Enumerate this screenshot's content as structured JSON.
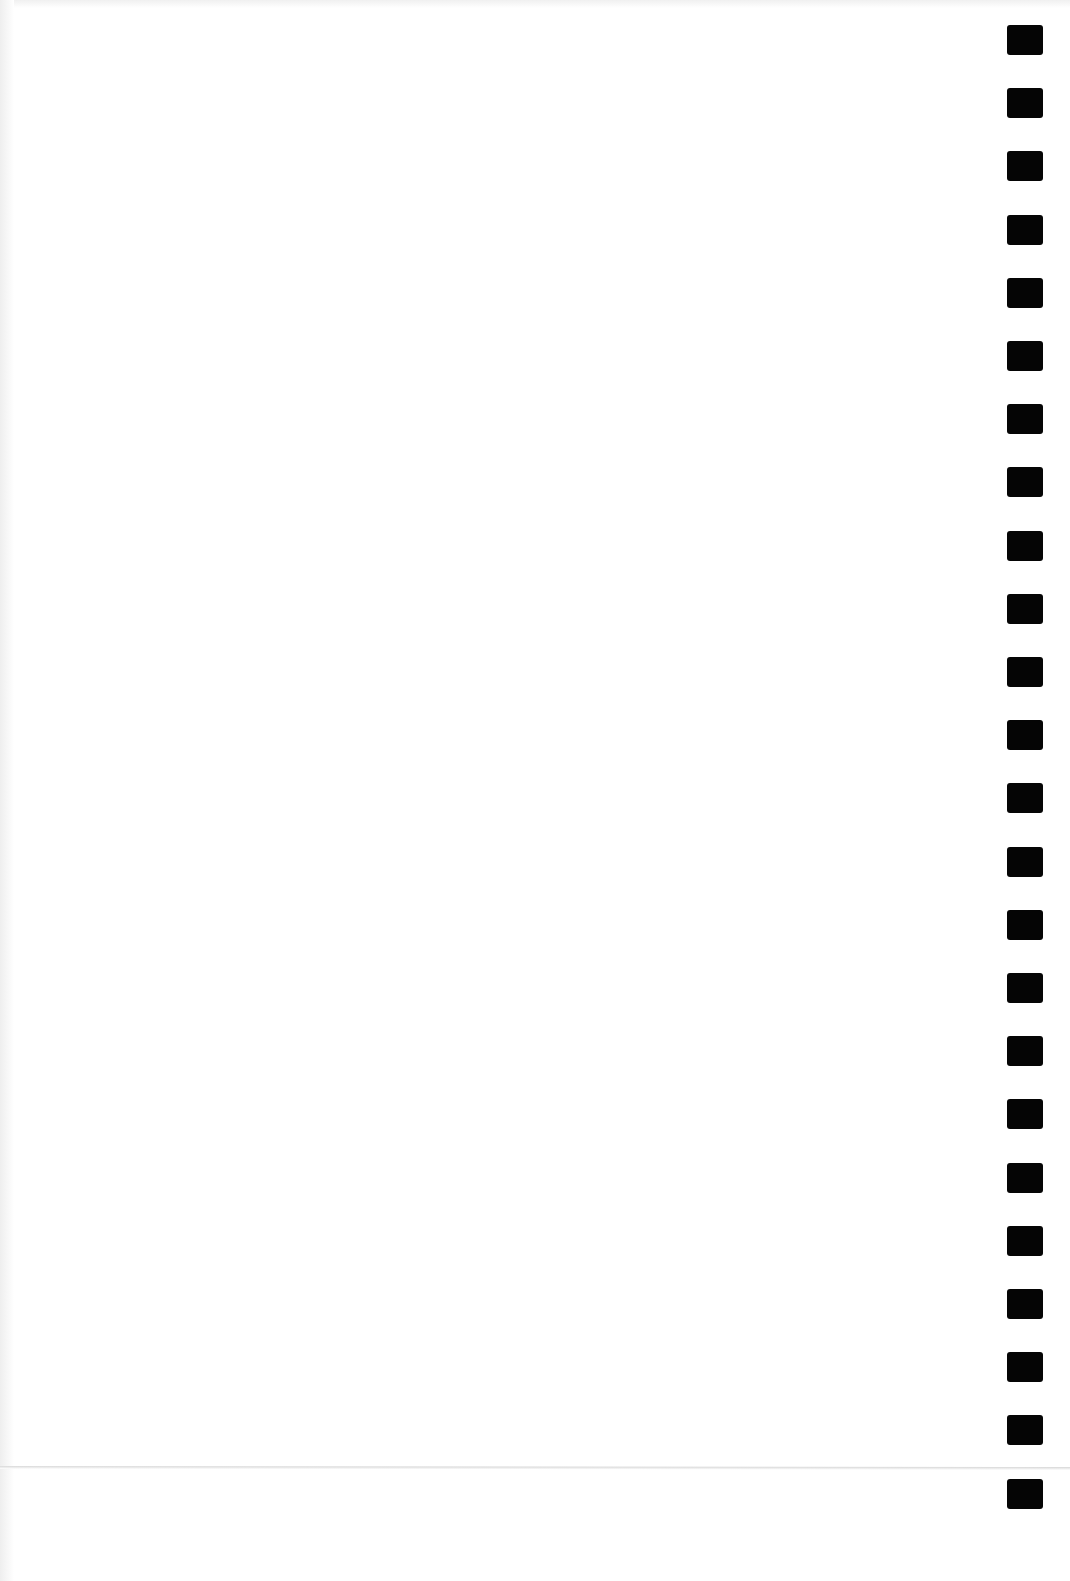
{
  "page": {
    "type": "blank scanned sheet",
    "background_color": "#ffffff",
    "text": ""
  },
  "registration_marks": {
    "count": 24,
    "color": "#050505",
    "side": "right",
    "first_top_px": 25,
    "spacing_px": 63.2
  },
  "fold_line": {
    "visible": true,
    "y_px": 1467
  }
}
